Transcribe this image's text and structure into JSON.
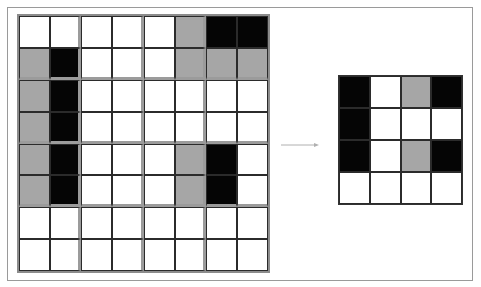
{
  "diagram": {
    "colors": {
      "W": "#ffffff",
      "G": "#a6a6a6",
      "B": "#050505",
      "frame": "#9a9a9a",
      "pool_divider": "#9b9b9b",
      "arrow": "#b0b0b0"
    },
    "input_grid": {
      "rows": 8,
      "cols": 8,
      "block_size": 2,
      "cells": [
        [
          "W",
          "W",
          "W",
          "W",
          "W",
          "G",
          "B",
          "B"
        ],
        [
          "G",
          "B",
          "W",
          "W",
          "W",
          "G",
          "G",
          "G"
        ],
        [
          "G",
          "B",
          "W",
          "W",
          "W",
          "W",
          "W",
          "W"
        ],
        [
          "G",
          "B",
          "W",
          "W",
          "W",
          "W",
          "W",
          "W"
        ],
        [
          "G",
          "B",
          "W",
          "W",
          "W",
          "G",
          "B",
          "W"
        ],
        [
          "G",
          "B",
          "W",
          "W",
          "W",
          "G",
          "B",
          "W"
        ],
        [
          "W",
          "W",
          "W",
          "W",
          "W",
          "W",
          "W",
          "W"
        ],
        [
          "W",
          "W",
          "W",
          "W",
          "W",
          "W",
          "W",
          "W"
        ]
      ]
    },
    "arrow": {
      "direction": "right"
    },
    "output_grid": {
      "rows": 4,
      "cols": 4,
      "cells": [
        [
          "B",
          "W",
          "G",
          "B"
        ],
        [
          "B",
          "W",
          "W",
          "W"
        ],
        [
          "B",
          "W",
          "G",
          "B"
        ],
        [
          "W",
          "W",
          "W",
          "W"
        ]
      ]
    }
  }
}
